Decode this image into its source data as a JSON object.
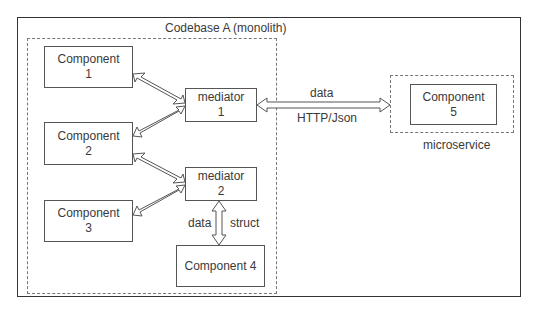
{
  "monolith": {
    "title": "Codebase A (monolith)"
  },
  "components": [
    {
      "line1": "Component",
      "line2": "1"
    },
    {
      "line1": "Component",
      "line2": "2"
    },
    {
      "line1": "Component",
      "line2": "3"
    },
    {
      "line1": "Component 4",
      "line2": ""
    },
    {
      "line1": "Component",
      "line2": "5"
    }
  ],
  "mediators": [
    {
      "line1": "mediator",
      "line2": "1"
    },
    {
      "line1": "mediator",
      "line2": "2"
    }
  ],
  "microservice": {
    "label": "microservice"
  },
  "links": {
    "http_top": "data",
    "http_bottom": "HTTP/Json",
    "m2_c4_left": "data",
    "m2_c4_right": "struct"
  },
  "colors": {
    "line": "#555555",
    "text": "#3a3a3a",
    "dash": "#777777"
  }
}
